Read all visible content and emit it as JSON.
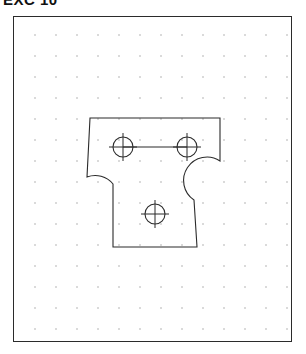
{
  "document": {
    "title": "EXC 10",
    "kind": "technical-drawing-exercise"
  },
  "frame": {
    "label": "drawing-border",
    "x": 13,
    "y": 16,
    "width": 279,
    "height": 326,
    "border_color": "#2b2b2b"
  },
  "grid": {
    "label": "snap-grid",
    "style": "dot",
    "spacing_px": 21,
    "origin_x": 13,
    "origin_y": 13,
    "columns": 13,
    "rows": 15,
    "dot_color": "#9a9a9a"
  },
  "part": {
    "name": "t-shaped-bracket",
    "line_color": "#2b2b2b",
    "flange": {
      "label": "top-flange",
      "left": 89,
      "right": 219,
      "top": 117,
      "bottom": 160
    },
    "stem": {
      "label": "bottom-stem",
      "left": 112,
      "right": 196,
      "top": 190,
      "bottom": 246
    },
    "fillets": [
      {
        "label": "left-fillet",
        "radius": 23
      },
      {
        "label": "right-fillet",
        "radius": 23
      }
    ],
    "outline_path": "M 89 117 L 219 117 L 219 160 A 23 23 0 0 0 196 183 L 196 246 L 112 246 L 112 183 A 23 23 0 0 0 89 160 Z"
  },
  "holes": [
    {
      "label": "hole-top-left",
      "cx": 122,
      "cy": 146,
      "r": 10,
      "center_mark_len": 14
    },
    {
      "label": "hole-top-right",
      "cx": 186,
      "cy": 146,
      "r": 10,
      "center_mark_len": 14
    },
    {
      "label": "hole-bottom",
      "cx": 154,
      "cy": 213,
      "r": 10,
      "center_mark_len": 14
    }
  ],
  "construction_lines": [
    {
      "label": "hole-axis-link",
      "x1": 122,
      "y1": 146,
      "x2": 186,
      "y2": 146
    }
  ]
}
